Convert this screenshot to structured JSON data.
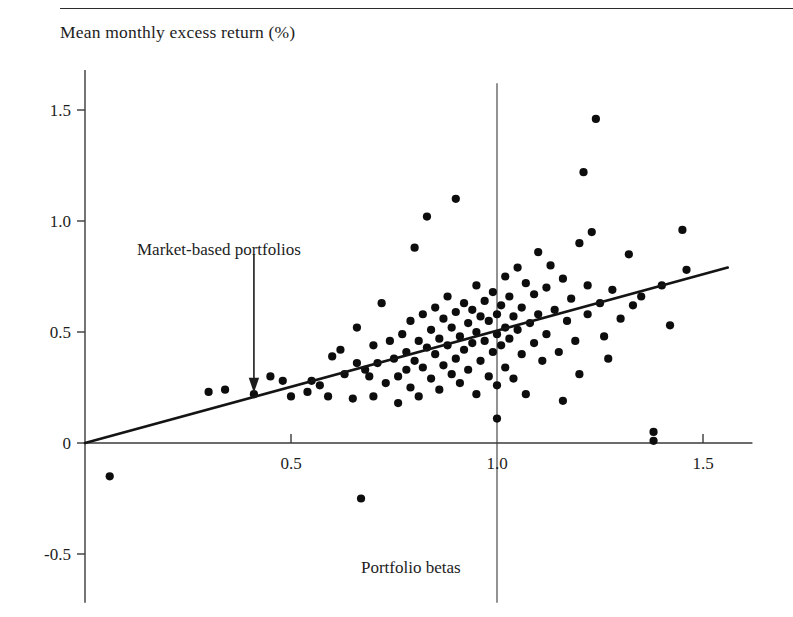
{
  "figure": {
    "ylabel": "Mean monthly excess return (%)",
    "xlabel": "Portfolio betas",
    "annotation": "Market-based portfolios"
  },
  "axis": {
    "y_ticks": [
      "1.5",
      "1.0",
      "0.5",
      "0",
      "-0.5"
    ],
    "x_ticks": [
      "0.5",
      "1.0",
      "1.5"
    ]
  },
  "colors": {
    "ink": "#1a1a1a",
    "axis": "#3a3a3a",
    "point": "#0d0d0d",
    "background": "#ffffff"
  },
  "chart_data": {
    "type": "scatter",
    "title": "",
    "xlabel": "Portfolio betas",
    "ylabel": "Mean monthly excess return (%)",
    "xlim": [
      -0.05,
      1.62
    ],
    "ylim": [
      -0.72,
      1.68
    ],
    "xticks": [
      0.5,
      1.0,
      1.5
    ],
    "yticks": [
      -0.5,
      0,
      0.5,
      1.0,
      1.5
    ],
    "grid": false,
    "legend": null,
    "annotations": [
      {
        "text": "Market-based portfolios",
        "text_x": 0.28,
        "text_y": 0.92,
        "arrow_from_x": 0.41,
        "arrow_from_y": 0.85,
        "arrow_to_x": 0.41,
        "arrow_to_y": 0.24
      }
    ],
    "reference_lines": [
      {
        "type": "vertical",
        "x": 1.0,
        "y_from": -0.72,
        "y_to": 1.62
      }
    ],
    "fit_line": {
      "label": "security market line",
      "x_from": 0.0,
      "y_from": 0.0,
      "x_to": 1.56,
      "y_to": 0.79,
      "slope": 0.506,
      "intercept": 0.0
    },
    "points": [
      [
        0.06,
        -0.15
      ],
      [
        0.3,
        0.23
      ],
      [
        0.34,
        0.24
      ],
      [
        0.41,
        0.22
      ],
      [
        0.45,
        0.3
      ],
      [
        0.48,
        0.28
      ],
      [
        0.5,
        0.21
      ],
      [
        0.54,
        0.23
      ],
      [
        0.55,
        0.28
      ],
      [
        0.57,
        0.26
      ],
      [
        0.59,
        0.21
      ],
      [
        0.6,
        0.39
      ],
      [
        0.62,
        0.42
      ],
      [
        0.63,
        0.31
      ],
      [
        0.65,
        0.2
      ],
      [
        0.66,
        0.52
      ],
      [
        0.66,
        0.36
      ],
      [
        0.67,
        -0.25
      ],
      [
        0.68,
        0.33
      ],
      [
        0.69,
        0.3
      ],
      [
        0.7,
        0.44
      ],
      [
        0.7,
        0.21
      ],
      [
        0.71,
        0.36
      ],
      [
        0.72,
        0.63
      ],
      [
        0.73,
        0.27
      ],
      [
        0.74,
        0.46
      ],
      [
        0.75,
        0.38
      ],
      [
        0.76,
        0.3
      ],
      [
        0.76,
        0.18
      ],
      [
        0.77,
        0.49
      ],
      [
        0.78,
        0.41
      ],
      [
        0.78,
        0.33
      ],
      [
        0.79,
        0.55
      ],
      [
        0.79,
        0.25
      ],
      [
        0.8,
        0.37
      ],
      [
        0.8,
        0.88
      ],
      [
        0.81,
        0.46
      ],
      [
        0.81,
        0.21
      ],
      [
        0.82,
        0.58
      ],
      [
        0.82,
        0.34
      ],
      [
        0.83,
        1.02
      ],
      [
        0.83,
        0.43
      ],
      [
        0.84,
        0.51
      ],
      [
        0.84,
        0.29
      ],
      [
        0.85,
        0.61
      ],
      [
        0.85,
        0.4
      ],
      [
        0.86,
        0.47
      ],
      [
        0.86,
        0.24
      ],
      [
        0.87,
        0.56
      ],
      [
        0.87,
        0.35
      ],
      [
        0.88,
        0.66
      ],
      [
        0.88,
        0.44
      ],
      [
        0.89,
        0.52
      ],
      [
        0.89,
        0.31
      ],
      [
        0.9,
        1.1
      ],
      [
        0.9,
        0.59
      ],
      [
        0.9,
        0.38
      ],
      [
        0.91,
        0.48
      ],
      [
        0.91,
        0.27
      ],
      [
        0.92,
        0.63
      ],
      [
        0.92,
        0.42
      ],
      [
        0.93,
        0.54
      ],
      [
        0.93,
        0.33
      ],
      [
        0.94,
        0.6
      ],
      [
        0.94,
        0.45
      ],
      [
        0.95,
        0.71
      ],
      [
        0.95,
        0.5
      ],
      [
        0.95,
        0.22
      ],
      [
        0.96,
        0.57
      ],
      [
        0.96,
        0.37
      ],
      [
        0.97,
        0.64
      ],
      [
        0.97,
        0.46
      ],
      [
        0.98,
        0.55
      ],
      [
        0.98,
        0.3
      ],
      [
        0.99,
        0.68
      ],
      [
        0.99,
        0.41
      ],
      [
        1.0,
        0.58
      ],
      [
        1.0,
        0.49
      ],
      [
        1.0,
        0.26
      ],
      [
        1.0,
        0.11
      ],
      [
        1.01,
        0.62
      ],
      [
        1.01,
        0.44
      ],
      [
        1.02,
        0.75
      ],
      [
        1.02,
        0.52
      ],
      [
        1.02,
        0.34
      ],
      [
        1.03,
        0.66
      ],
      [
        1.03,
        0.47
      ],
      [
        1.04,
        0.57
      ],
      [
        1.04,
        0.29
      ],
      [
        1.05,
        0.79
      ],
      [
        1.05,
        0.51
      ],
      [
        1.06,
        0.61
      ],
      [
        1.06,
        0.4
      ],
      [
        1.07,
        0.72
      ],
      [
        1.07,
        0.22
      ],
      [
        1.08,
        0.54
      ],
      [
        1.09,
        0.67
      ],
      [
        1.09,
        0.45
      ],
      [
        1.1,
        0.86
      ],
      [
        1.1,
        0.58
      ],
      [
        1.11,
        0.37
      ],
      [
        1.12,
        0.7
      ],
      [
        1.12,
        0.49
      ],
      [
        1.13,
        0.8
      ],
      [
        1.14,
        0.6
      ],
      [
        1.15,
        0.41
      ],
      [
        1.16,
        0.74
      ],
      [
        1.16,
        0.19
      ],
      [
        1.17,
        0.55
      ],
      [
        1.18,
        0.65
      ],
      [
        1.19,
        0.46
      ],
      [
        1.2,
        0.9
      ],
      [
        1.2,
        0.31
      ],
      [
        1.21,
        1.22
      ],
      [
        1.22,
        0.71
      ],
      [
        1.22,
        0.58
      ],
      [
        1.23,
        0.95
      ],
      [
        1.24,
        1.46
      ],
      [
        1.25,
        0.63
      ],
      [
        1.26,
        0.48
      ],
      [
        1.27,
        0.38
      ],
      [
        1.28,
        0.69
      ],
      [
        1.3,
        0.56
      ],
      [
        1.32,
        0.85
      ],
      [
        1.33,
        0.62
      ],
      [
        1.35,
        0.66
      ],
      [
        1.38,
        0.05
      ],
      [
        1.38,
        0.01
      ],
      [
        1.4,
        0.71
      ],
      [
        1.42,
        0.53
      ],
      [
        1.45,
        0.96
      ],
      [
        1.46,
        0.78
      ]
    ]
  }
}
